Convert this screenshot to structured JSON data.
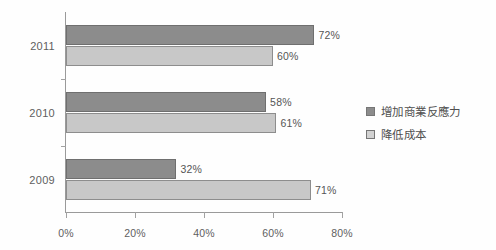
{
  "chart_data": {
    "type": "bar",
    "orientation": "horizontal",
    "title": "",
    "xlabel": "",
    "ylabel": "",
    "categories": [
      "2011",
      "2010",
      "2009"
    ],
    "series": [
      {
        "name": "增加商業反應力",
        "color": "#8c8c8c",
        "values": [
          72,
          58,
          32
        ],
        "labels": [
          "72%",
          "58%",
          "32%"
        ]
      },
      {
        "name": "降低成本",
        "color": "#c8c8c8",
        "values": [
          60,
          61,
          71
        ],
        "labels": [
          "60%",
          "61%",
          "71%"
        ]
      }
    ],
    "xlim": [
      0,
      80
    ],
    "xticks": [
      0,
      20,
      40,
      60,
      80
    ],
    "xtick_labels": [
      "0%",
      "20%",
      "40%",
      "60%",
      "80%"
    ],
    "grid": false,
    "legend_position": "right"
  },
  "legend": {
    "items": [
      {
        "label": "增加商業反應力",
        "color": "#8c8c8c"
      },
      {
        "label": "降低成本",
        "color": "#c8c8c8"
      }
    ]
  },
  "colors": {
    "series_dark": "#8c8c8c",
    "series_light": "#c8c8c8",
    "axis": "#9a9a9a",
    "text": "#5a5a5a",
    "background": "#ffffff"
  }
}
